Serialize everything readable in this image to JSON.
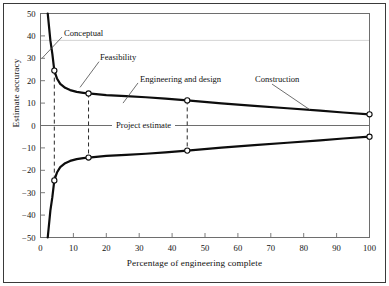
{
  "chart_data": {
    "type": "line",
    "title": "",
    "xlabel": "Percentage of engineering complete",
    "ylabel": "Estimate accuracy",
    "xlim": [
      0,
      100
    ],
    "ylim": [
      -50,
      50
    ],
    "xticks": [
      0,
      10,
      20,
      30,
      40,
      50,
      60,
      70,
      80,
      90,
      100
    ],
    "yticks": [
      -50,
      -40,
      -30,
      -20,
      -10,
      0,
      10,
      20,
      30,
      40,
      50
    ],
    "grid": false,
    "legend": "none",
    "baseline_value": 0,
    "baseline_label": "Project estimate",
    "series": [
      {
        "name": "Upper accuracy band",
        "x": [
          2.2,
          3.0,
          3.6,
          4.2,
          5.0,
          6.0,
          7.5,
          9.0,
          11.0,
          13.0,
          14.6,
          20.0,
          26.0,
          32.0,
          38.0,
          44.6,
          55.0,
          65.0,
          75.0,
          85.0,
          92.0,
          100.0
        ],
        "y": [
          50.0,
          38.0,
          32.0,
          24.5,
          21.0,
          18.6,
          16.8,
          15.8,
          15.0,
          14.6,
          14.3,
          13.6,
          13.1,
          12.6,
          12.0,
          11.2,
          9.9,
          8.8,
          7.7,
          6.6,
          5.8,
          5.0
        ]
      },
      {
        "name": "Lower accuracy band",
        "x": [
          2.2,
          3.0,
          3.6,
          4.2,
          5.0,
          6.0,
          7.5,
          9.0,
          11.0,
          13.0,
          14.6,
          20.0,
          26.0,
          32.0,
          38.0,
          44.6,
          55.0,
          65.0,
          75.0,
          85.0,
          92.0,
          100.0
        ],
        "y": [
          -50.0,
          -38.0,
          -32.0,
          -24.5,
          -21.0,
          -18.6,
          -16.8,
          -15.8,
          -15.0,
          -14.6,
          -14.3,
          -13.6,
          -13.1,
          -12.6,
          -12.0,
          -11.2,
          -9.9,
          -8.8,
          -7.7,
          -6.6,
          -5.8,
          -5.0
        ]
      }
    ],
    "markers": [
      {
        "x": 4.2,
        "y": 24.5,
        "style": "open-circle"
      },
      {
        "x": 14.6,
        "y": 14.3,
        "style": "open-circle"
      },
      {
        "x": 44.6,
        "y": 11.2,
        "style": "open-circle"
      },
      {
        "x": 100.0,
        "y": 5.0,
        "style": "open-circle"
      },
      {
        "x": 4.2,
        "y": -24.5,
        "style": "open-circle"
      },
      {
        "x": 14.6,
        "y": -14.3,
        "style": "open-circle"
      },
      {
        "x": 44.6,
        "y": -11.2,
        "style": "open-circle"
      },
      {
        "x": 100.0,
        "y": -5.0,
        "style": "open-circle"
      }
    ],
    "dashed_connectors": [
      {
        "x": 4.2,
        "y_top": 24.5,
        "y_bottom": -24.5
      },
      {
        "x": 14.6,
        "y_top": 14.3,
        "y_bottom": -14.3
      },
      {
        "x": 44.6,
        "y_top": 11.2,
        "y_bottom": -11.2
      }
    ],
    "annotations": [
      {
        "label": "Conceptual",
        "text_x": 64,
        "text_y": 41,
        "leader": {
          "x1": 62,
          "y1": 39.5,
          "x2": 42,
          "y2": 30
        }
      },
      {
        "label": "Feasibility",
        "text_x": 100,
        "text_y": 30,
        "leader": {
          "x1": 99,
          "y1": 28.5,
          "x2": 80,
          "y2": 17
        }
      },
      {
        "label": "Engineering and design",
        "text_x": 140,
        "text_y": 20.5,
        "leader": {
          "x1": 138,
          "y1": 19,
          "x2": 123,
          "y2": 10
        }
      },
      {
        "label": "Construction",
        "text_x": 255,
        "text_y": 20.5,
        "leader": {
          "x1": 272,
          "y1": 18.5,
          "x2": 310,
          "y2": 7
        }
      }
    ]
  },
  "colors": {
    "curve": "#0d0d0d",
    "axis": "#6e6e6e",
    "frame": "#3a3a3a",
    "dashed": "#2a2a2a",
    "text": "#111111",
    "marker_fill": "#ffffff",
    "gridline": "#c9c9c9"
  }
}
